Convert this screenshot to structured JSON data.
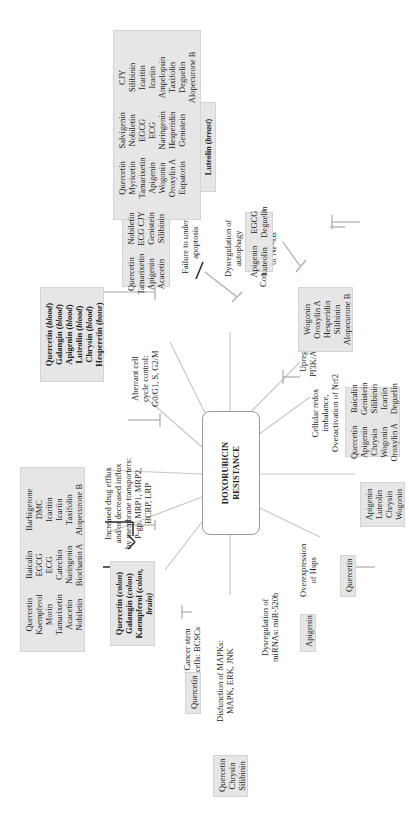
{
  "center": {
    "line1": "DOXORUBICIN",
    "line2": "RESISTANCE"
  },
  "mechanisms": [
    {
      "id": "apoptosis",
      "lines": [
        "Failure to undergo",
        "apoptosis"
      ]
    },
    {
      "id": "autophagy",
      "lines": [
        "Dysregulation of",
        "autophagy"
      ]
    },
    {
      "id": "nfkb",
      "lines": [
        "Constitutive activation",
        "of NF-κB"
      ]
    },
    {
      "id": "pi3k",
      "lines": [
        "Upregulation of",
        "PI3K/Akt pathway"
      ]
    },
    {
      "id": "nrf2",
      "lines": [
        "Cellular redox",
        "imbalance,",
        "Overactivation of Nrf2"
      ]
    },
    {
      "id": "hsps",
      "lines": [
        "Overexpression",
        "of Hsps"
      ]
    },
    {
      "id": "mirna",
      "lines": [
        "Dysregulation of",
        "miRNAs: miR-520b"
      ]
    },
    {
      "id": "mapk",
      "lines": [
        "Disfunction of MAPKs:",
        "MAPK, ERK, JNK"
      ]
    },
    {
      "id": "csc",
      "lines": [
        "Cancer stem",
        "cells: BCSCs"
      ]
    },
    {
      "id": "efflux",
      "lines": [
        "Increased drug efflux",
        "and/or decreased influx",
        "by membrane transporters:",
        "P-gp, MRP1, MRP2,",
        "BCRP, LRP"
      ]
    },
    {
      "id": "cellcycle",
      "lines": [
        "Aberrant cell",
        "cycle control:",
        "G0/G1, S, G2/M"
      ]
    }
  ],
  "inhibitor_boxes": {
    "apoptosis_large": {
      "columns": [
        [
          "Quercetin",
          "Myricetin",
          "Tamarixetin",
          "Apigenin",
          "Wogonin",
          "Oroxylin A",
          "Eupatorin"
        ],
        [
          "Salvigenin",
          "Nobiletin",
          "EGCG",
          "ECG",
          "Naringenin",
          "Hesperidin",
          "Genistein"
        ],
        [
          "CJY",
          "Silibinin",
          "Icaritin",
          "Icariin",
          "Ampelopsin",
          "Taxifolin",
          "Deguelin",
          "Alopecurone B"
        ]
      ]
    },
    "cellcycle": {
      "columns": [
        [
          "Quercetin",
          "Tamarixetin",
          "Apigenin",
          "Acacetin"
        ],
        [
          "Nobiletin",
          "ECG  CJY",
          "Genistein",
          "Silibinin"
        ]
      ]
    },
    "autophagy": {
      "columns": [
        [
          "Apigenin",
          "Luteolin"
        ],
        [
          "EGCG",
          "Deguelin"
        ]
      ]
    },
    "nfkb": {
      "columns": [
        [
          "Wogonin",
          "Oroxylin A",
          "Hesperidin",
          "Silibinin",
          "Alopecurone B"
        ]
      ]
    },
    "pi3k": {
      "columns": [
        [
          "Quercetin",
          "Apigenin",
          "Chrysin",
          "Wogonin",
          "Oroxylin A"
        ],
        [
          "Baicalin",
          "Genistein",
          "Silibinin",
          "Icariin",
          "Deguelin"
        ]
      ]
    },
    "nrf2": {
      "columns": [
        [
          "Apigenin",
          "Luteolin",
          "Chrysin",
          "Wogonin"
        ]
      ]
    },
    "hsps": {
      "columns": [
        [
          "Quercetin"
        ]
      ]
    },
    "mirna": {
      "columns": [
        [
          "Apigenin"
        ]
      ]
    },
    "mapk": {
      "columns": [
        [
          "Quercetin",
          "Chrysin",
          "Silibinin"
        ]
      ]
    },
    "csc": {
      "columns": [
        [
          "Quercetin"
        ]
      ]
    },
    "efflux": {
      "columns": [
        [
          "Quercetin",
          "Kaempferol",
          "Morin",
          "Tamarixetin",
          "Acacetin",
          "Nobiletin"
        ],
        [
          "Baicalin",
          "EGCG",
          "ECG",
          "Catechin",
          "Naringenin",
          "Biochanin A"
        ],
        [
          "Barbigerone",
          "DMC",
          "Icaritin",
          "Icariin",
          "Taxifolin",
          "Alopecurone B"
        ]
      ]
    }
  },
  "promoter_boxes": {
    "apoptosis": {
      "lines": [
        {
          "name": "Luteolin",
          "tissue": "breast"
        }
      ]
    },
    "cellcycle": {
      "lines": [
        {
          "name": "Quercetin",
          "tissue": "blood"
        },
        {
          "name": "Galangin",
          "tissue": "blood"
        },
        {
          "name": "Apigenin",
          "tissue": "blood"
        },
        {
          "name": "Luteolin",
          "tissue": "blood"
        },
        {
          "name": "Chrysin",
          "tissue": "blood"
        },
        {
          "name": "Hesperetin",
          "tissue": "bone"
        }
      ]
    },
    "efflux": {
      "lines": [
        {
          "name": "Quercetin",
          "tissue": "colon"
        },
        {
          "name": "Galangin",
          "tissue": "colon"
        },
        {
          "name": "Kaempferol",
          "tissue": "colon,"
        },
        {
          "name": "",
          "tissue": "brain)"
        }
      ]
    }
  }
}
